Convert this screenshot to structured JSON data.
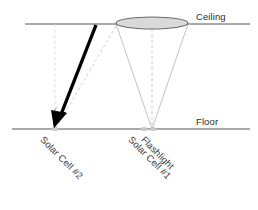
{
  "diagram": {
    "type": "physics-ray-diagram",
    "canvas": {
      "width": 258,
      "height": 210
    },
    "surfaces": {
      "ceiling": {
        "label": "Ceiling",
        "y": 24,
        "x_start": 25,
        "x_end": 250,
        "color": "#555555"
      },
      "floor": {
        "label": "Floor",
        "y": 129,
        "x_start": 12,
        "x_end": 250,
        "color": "#555555"
      }
    },
    "beam_spot": {
      "name": "ceiling-light-spot",
      "shape": "ellipse",
      "center_x": 152,
      "center_y": 23,
      "radius_x": 36,
      "radius_y": 6,
      "fill_color": "#d9d9d9",
      "stroke_color": "#6b6b6b"
    },
    "light_cone": {
      "name": "flashlight-beam-cone",
      "apex_x": 152,
      "apex_y": 129,
      "left_edge_x": 116,
      "right_edge_x": 188,
      "edge_y": 23,
      "stroke_color": "#b8b8b8"
    },
    "center_axis": {
      "name": "beam-center-axis",
      "x1": 152,
      "y1": 23,
      "x2": 152,
      "y2": 129,
      "style": "dashed",
      "color": "#bcbcbc"
    },
    "reflected_ray": {
      "name": "reflected-ray-dashed",
      "x1": 116,
      "y1": 26,
      "x2": 56,
      "y2": 128,
      "style": "dashed",
      "color": "#c6c6c6"
    },
    "cell2_axis": {
      "name": "solar-cell-2-vertical-axis",
      "x1": 55,
      "y1": 24,
      "x2": 55,
      "y2": 129,
      "style": "dashed",
      "color": "#d2d2d2"
    },
    "incident_arrow": {
      "name": "incident-light-arrow",
      "x1": 96,
      "y1": 25,
      "x2": 57,
      "y2": 125,
      "tip_x": 54,
      "tip_y": 128,
      "color": "#000000",
      "stroke_width": 3.4
    },
    "markers": [
      {
        "name": "solar-cell-2-marker",
        "x": 55,
        "y": 129,
        "color": "#bdbdbd"
      },
      {
        "name": "solar-cell-1-marker",
        "x": 144,
        "y": 129,
        "color": "#bdbdbd"
      },
      {
        "name": "flashlight-marker",
        "x": 153,
        "y": 129,
        "color": "#bdbdbd"
      }
    ],
    "labels": {
      "solar_cell_2": "Solar Cell #2",
      "solar_cell_1": "Solar Cell #1",
      "flashlight": "Flashlight"
    }
  }
}
